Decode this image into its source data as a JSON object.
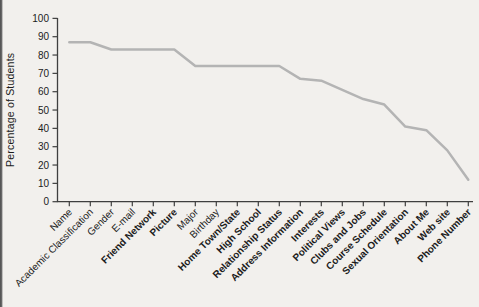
{
  "figure": {
    "background_color": "#f2f0ed",
    "scan_edge_color": "#4e4e4e"
  },
  "chart_data": {
    "type": "line",
    "title": "",
    "xlabel": "",
    "ylabel": "Percentage of Students",
    "ylim": [
      0,
      100
    ],
    "ytick_interval": 10,
    "yticks": [
      0,
      10,
      20,
      30,
      40,
      50,
      60,
      70,
      80,
      90,
      100
    ],
    "grid": false,
    "legend": "none",
    "line_color": "#b4b4b4",
    "axis_color": "#3f3f3f",
    "text_color": "#1c1c1c",
    "categories": [
      "Name",
      "Academic Classification",
      "Gender",
      "E-mail",
      "Friend Network",
      "Picture",
      "Major",
      "Birthday",
      "Home Town/State",
      "High School",
      "Relationship Status",
      "Address Information",
      "Interests",
      "Political Views",
      "Clubs and Jobs",
      "Course Schedule",
      "Sexual Orientation",
      "About Me",
      "Web site",
      "Phone Number"
    ],
    "bold_categories": [
      "Friend Network",
      "Picture",
      "Home Town/State",
      "High School",
      "Relationship Status",
      "Address Information",
      "Interests",
      "Political Views",
      "Clubs and Jobs",
      "Course Schedule",
      "Sexual Orientation",
      "About Me",
      "Web site",
      "Phone Number"
    ],
    "values": [
      87,
      87,
      83,
      83,
      83,
      83,
      74,
      74,
      74,
      74,
      74,
      67,
      66,
      61,
      56,
      53,
      41,
      39,
      28,
      12
    ]
  }
}
